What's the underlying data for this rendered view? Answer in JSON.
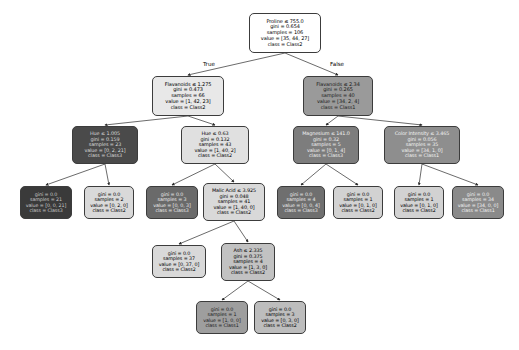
{
  "figure": {
    "type": "decision-tree",
    "background": "#ffffff",
    "edge_color": "#2b2b2b",
    "node_border_color": "#3c3c3c",
    "edge_labels": [
      {
        "text": "True",
        "x": 203,
        "y": 61,
        "font_size": 5.6
      },
      {
        "text": "False",
        "x": 330,
        "y": 61,
        "font_size": 5.6
      }
    ],
    "edges": [
      {
        "from": "n0",
        "to": "n1"
      },
      {
        "from": "n0",
        "to": "n2"
      },
      {
        "from": "n1",
        "to": "n3"
      },
      {
        "from": "n1",
        "to": "n4"
      },
      {
        "from": "n2",
        "to": "n5"
      },
      {
        "from": "n2",
        "to": "n6"
      },
      {
        "from": "n3",
        "to": "n7"
      },
      {
        "from": "n3",
        "to": "n8"
      },
      {
        "from": "n4",
        "to": "n9"
      },
      {
        "from": "n4",
        "to": "n10"
      },
      {
        "from": "n5",
        "to": "n11"
      },
      {
        "from": "n5",
        "to": "n12"
      },
      {
        "from": "n6",
        "to": "n13"
      },
      {
        "from": "n6",
        "to": "n14"
      },
      {
        "from": "n10",
        "to": "n15"
      },
      {
        "from": "n10",
        "to": "n16"
      },
      {
        "from": "n16",
        "to": "n17"
      },
      {
        "from": "n16",
        "to": "n18"
      }
    ]
  },
  "nodes": [
    {
      "id": "n0",
      "x": 249,
      "y": 13,
      "w": 72,
      "h": 40,
      "fill": "#ffffff",
      "text_color": "#000000",
      "font_size": 5.0,
      "lines": [
        "Proline ≤ 755.0",
        "gini = 0.654",
        "samples = 106",
        "value = [35, 44, 27]",
        "class = Class2"
      ]
    },
    {
      "id": "n1",
      "x": 152,
      "y": 76,
      "w": 72,
      "h": 40,
      "fill": "#e8e8e8",
      "text_color": "#000000",
      "font_size": 5.0,
      "lines": [
        "Flavanoids ≤ 1.275",
        "gini = 0.473",
        "samples = 66",
        "value = [1, 42, 23]",
        "class = Class2"
      ]
    },
    {
      "id": "n2",
      "x": 303,
      "y": 76,
      "w": 70,
      "h": 40,
      "fill": "#9a9a9a",
      "text_color": "#1a1a1a",
      "font_size": 5.0,
      "lines": [
        "Flavanoids ≤ 2.34",
        "gini = 0.265",
        "samples = 40",
        "value = [34, 2, 4]",
        "class = Class1"
      ]
    },
    {
      "id": "n3",
      "x": 72,
      "y": 126,
      "w": 66,
      "h": 38,
      "fill": "#4a4a4a",
      "text_color": "#d8d8d8",
      "font_size": 4.9,
      "lines": [
        "Hue ≤ 1.005",
        "gini = 0.159",
        "samples = 23",
        "value = [0, 2, 21]",
        "class = Class3"
      ]
    },
    {
      "id": "n4",
      "x": 181,
      "y": 126,
      "w": 68,
      "h": 38,
      "fill": "#e0e0e0",
      "text_color": "#000000",
      "font_size": 4.9,
      "lines": [
        "Hue ≤ 0.63",
        "gini = 0.132",
        "samples = 43",
        "value = [1, 40, 2]",
        "class = Class2"
      ]
    },
    {
      "id": "n5",
      "x": 293,
      "y": 126,
      "w": 66,
      "h": 38,
      "fill": "#7d7d7d",
      "text_color": "#f0f0f0",
      "font_size": 4.9,
      "lines": [
        "Magnesium ≤ 141.0",
        "gini = 0.32",
        "samples = 5",
        "value = [0, 1, 4]",
        "class = Class3"
      ]
    },
    {
      "id": "n6",
      "x": 384,
      "y": 126,
      "w": 76,
      "h": 38,
      "fill": "#8e8e8e",
      "text_color": "#f2f2f2",
      "font_size": 4.9,
      "lines": [
        "Color Intensity ≤ 3.465",
        "gini = 0.056",
        "samples = 35",
        "value = [34, 1, 0]",
        "class = Class1"
      ]
    },
    {
      "id": "n7",
      "x": 20,
      "y": 186,
      "w": 52,
      "h": 33,
      "fill": "#3a3a3a",
      "text_color": "#c8c8c8",
      "font_size": 4.8,
      "lines": [
        "gini = 0.0",
        "samples = 21",
        "value = [0, 0, 21]",
        "class = Class3"
      ]
    },
    {
      "id": "n8",
      "x": 84,
      "y": 186,
      "w": 50,
      "h": 33,
      "fill": "#d9d9d9",
      "text_color": "#000000",
      "font_size": 4.8,
      "lines": [
        "gini = 0.0",
        "samples = 2",
        "value = [0, 2, 0]",
        "class = Class2"
      ]
    },
    {
      "id": "n9",
      "x": 146,
      "y": 186,
      "w": 52,
      "h": 33,
      "fill": "#6a6a6a",
      "text_color": "#ececec",
      "font_size": 4.8,
      "lines": [
        "gini = 0.0",
        "samples = 3",
        "value = [0, 0, 3]",
        "class = Class3"
      ]
    },
    {
      "id": "n10",
      "x": 203,
      "y": 183,
      "w": 62,
      "h": 38,
      "fill": "#d9d9d9",
      "text_color": "#000000",
      "font_size": 4.9,
      "lines": [
        "Malic Acid ≤ 3.925",
        "gini = 0.048",
        "samples = 41",
        "value = [1, 40, 0]",
        "class = Class2"
      ]
    },
    {
      "id": "n11",
      "x": 277,
      "y": 186,
      "w": 48,
      "h": 33,
      "fill": "#6f6f6f",
      "text_color": "#ececec",
      "font_size": 4.8,
      "lines": [
        "gini = 0.0",
        "samples = 4",
        "value = [0, 0, 4]",
        "class = Class3"
      ]
    },
    {
      "id": "n12",
      "x": 333,
      "y": 186,
      "w": 50,
      "h": 33,
      "fill": "#d2d2d2",
      "text_color": "#000000",
      "font_size": 4.8,
      "lines": [
        "gini = 0.0",
        "samples = 1",
        "value = [0, 1, 0]",
        "class = Class2"
      ]
    },
    {
      "id": "n13",
      "x": 394,
      "y": 186,
      "w": 50,
      "h": 33,
      "fill": "#d2d2d2",
      "text_color": "#000000",
      "font_size": 4.8,
      "lines": [
        "gini = 0.0",
        "samples = 1",
        "value = [0, 1, 0]",
        "class = Class2"
      ]
    },
    {
      "id": "n14",
      "x": 452,
      "y": 186,
      "w": 52,
      "h": 33,
      "fill": "#8a8a8a",
      "text_color": "#f2f2f2",
      "font_size": 4.8,
      "lines": [
        "gini = 0.0",
        "samples = 34",
        "value = [34, 0, 0]",
        "class = Class1"
      ]
    },
    {
      "id": "n15",
      "x": 152,
      "y": 245,
      "w": 54,
      "h": 33,
      "fill": "#d9d9d9",
      "text_color": "#000000",
      "font_size": 4.8,
      "lines": [
        "gini = 0.0",
        "samples = 37",
        "value = [0, 37, 0]",
        "class = Class2"
      ]
    },
    {
      "id": "n16",
      "x": 221,
      "y": 243,
      "w": 54,
      "h": 38,
      "fill": "#c2c2c2",
      "text_color": "#000000",
      "font_size": 4.9,
      "lines": [
        "Ash ≤ 2.335",
        "gini = 0.375",
        "samples = 4",
        "value = [1, 3, 0]",
        "class = Class2"
      ]
    },
    {
      "id": "n17",
      "x": 196,
      "y": 301,
      "w": 52,
      "h": 33,
      "fill": "#9e9e9e",
      "text_color": "#1a1a1a",
      "font_size": 4.8,
      "lines": [
        "gini = 0.0",
        "samples = 1",
        "value = [1, 0, 0]",
        "class = Class1"
      ]
    },
    {
      "id": "n18",
      "x": 254,
      "y": 301,
      "w": 52,
      "h": 33,
      "fill": "#bdbdbd",
      "text_color": "#000000",
      "font_size": 4.8,
      "lines": [
        "gini = 0.0",
        "samples = 3",
        "value = [0, 3, 0]",
        "class = Class2"
      ]
    }
  ]
}
